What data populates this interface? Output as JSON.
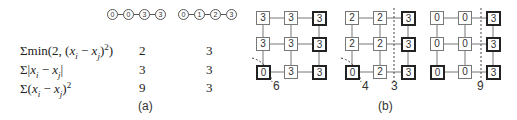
{
  "part_a": {
    "caption": "(a)",
    "chains": [
      {
        "labels": [
          "0",
          "0",
          "3",
          "3"
        ]
      },
      {
        "labels": [
          "0",
          "1",
          "2",
          "3"
        ]
      }
    ],
    "rows": [
      {
        "formula": "Σmin(2, (x_i − x_j)²)",
        "values": [
          "2",
          "3"
        ]
      },
      {
        "formula": "Σ|x_i − x_j|",
        "values": [
          "3",
          "3"
        ]
      },
      {
        "formula": "Σ(x_i − x_j)²",
        "values": [
          "9",
          "3"
        ]
      }
    ]
  },
  "part_b": {
    "caption": "(b)",
    "grids": [
      {
        "cells": [
          [
            "3",
            "3",
            "3"
          ],
          [
            "3",
            "3",
            "3"
          ],
          [
            "0",
            "3",
            "3"
          ]
        ],
        "bold": [
          [
            false,
            false,
            true
          ],
          [
            false,
            false,
            true
          ],
          [
            true,
            false,
            true
          ]
        ],
        "cut_labels": [
          "6"
        ]
      },
      {
        "cells": [
          [
            "2",
            "2",
            "3"
          ],
          [
            "2",
            "2",
            "3"
          ],
          [
            "0",
            "2",
            "3"
          ]
        ],
        "bold": [
          [
            false,
            false,
            true
          ],
          [
            false,
            false,
            true
          ],
          [
            true,
            false,
            true
          ]
        ],
        "cut_labels": [
          "4",
          "3"
        ]
      },
      {
        "cells": [
          [
            "0",
            "0",
            "3"
          ],
          [
            "0",
            "0",
            "3"
          ],
          [
            "0",
            "0",
            "3"
          ]
        ],
        "bold": [
          [
            false,
            false,
            true
          ],
          [
            false,
            false,
            true
          ],
          [
            true,
            false,
            true
          ]
        ],
        "cut_labels": [
          "9"
        ]
      }
    ]
  }
}
